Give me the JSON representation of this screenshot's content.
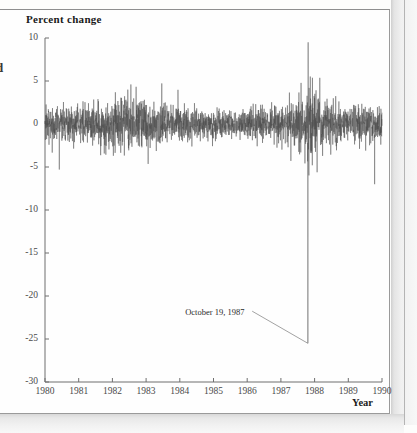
{
  "document": {
    "type": "scanned-book-page"
  },
  "margin_text": "d",
  "chart_data": {
    "type": "line",
    "title": "",
    "ylabel": "Percent change",
    "xlabel": "Year",
    "grid": false,
    "legend": null,
    "xlim": [
      1980,
      1990
    ],
    "ylim": [
      -30,
      10
    ],
    "ytick_labels": [
      "10",
      "5",
      "0",
      "-5",
      "-10",
      "-15",
      "-20",
      "-25",
      "-30"
    ],
    "ytick_values": [
      10,
      5,
      0,
      -5,
      -10,
      -15,
      -20,
      -25,
      -30
    ],
    "xtick_labels": [
      "1980",
      "1981",
      "1982",
      "1983",
      "1984",
      "1985",
      "1986",
      "1987",
      "1988",
      "1989",
      "1990"
    ],
    "xtick_values": [
      1980,
      1981,
      1982,
      1983,
      1984,
      1985,
      1986,
      1987,
      1988,
      1989,
      1990
    ],
    "annotations": [
      {
        "text": "October 19, 1987",
        "x": 1987.8,
        "y": -25.5,
        "label_x": 1986.0,
        "label_y": -22.0
      }
    ],
    "series": [
      {
        "name": "Daily percent change",
        "color": "#4d4d4d",
        "description": "Daily percent change in stock market index, 1980-1990, showing the October 19, 1987 crash of about -25.5 percent and the following-day rebound of about +9.5 percent.",
        "key_points": [
          {
            "x": 1987.8,
            "y": -25.5,
            "label": "October 19, 1987 crash"
          },
          {
            "x": 1987.81,
            "y": 9.5,
            "label": "October 20, 1987 rebound"
          },
          {
            "x": 1982.55,
            "y": 4.6,
            "label": "1982 rally spike"
          },
          {
            "x": 1989.78,
            "y": -7.0,
            "label": "October 1989 mini-crash"
          }
        ],
        "volatility_profile": [
          {
            "x": 1980.0,
            "sigma": 1.05
          },
          {
            "x": 1981.0,
            "sigma": 1.0
          },
          {
            "x": 1982.0,
            "sigma": 1.35
          },
          {
            "x": 1982.6,
            "sigma": 1.6
          },
          {
            "x": 1983.0,
            "sigma": 1.25
          },
          {
            "x": 1984.0,
            "sigma": 1.0
          },
          {
            "x": 1985.0,
            "sigma": 0.8
          },
          {
            "x": 1986.0,
            "sigma": 0.85
          },
          {
            "x": 1987.0,
            "sigma": 1.0
          },
          {
            "x": 1987.7,
            "sigma": 1.7
          },
          {
            "x": 1987.85,
            "sigma": 2.6
          },
          {
            "x": 1988.2,
            "sigma": 1.45
          },
          {
            "x": 1989.0,
            "sigma": 1.05
          },
          {
            "x": 1989.8,
            "sigma": 1.25
          },
          {
            "x": 1990.0,
            "sigma": 1.1
          }
        ]
      }
    ]
  }
}
